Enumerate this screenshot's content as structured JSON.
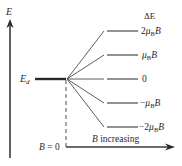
{
  "diagram": {
    "type": "zeeman-splitting",
    "energy_axis_label": "E",
    "degenerate_level_label_main": "E",
    "degenerate_level_label_sub": "d",
    "delta_e_header": "ΔE",
    "levels": [
      {
        "prefix": "2",
        "mu": "μ",
        "sub": "B",
        "suffix": "B",
        "y": 31
      },
      {
        "prefix": "",
        "mu": "μ",
        "sub": "B",
        "suffix": "B",
        "y": 55
      },
      {
        "text": "0",
        "y": 79
      },
      {
        "prefix": "−",
        "mu": "μ",
        "sub": "B",
        "suffix": "B",
        "y": 103
      },
      {
        "prefix": "−2",
        "mu": "μ",
        "sub": "B",
        "suffix": "B",
        "y": 127
      }
    ],
    "b_zero_label_var": "B",
    "b_zero_label_rest": " = 0",
    "b_axis_label_var": "B",
    "b_axis_label_rest": " increasing",
    "colors": {
      "line": "#3a3a3a",
      "text": "#2a2a2a"
    }
  }
}
